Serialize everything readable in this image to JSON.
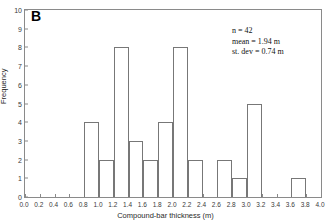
{
  "panel": {
    "label": "B"
  },
  "annotation": {
    "n": "n = 42",
    "mean": "mean = 1.94 m",
    "stdev": "st. dev = 0.74 m"
  },
  "chart_data": {
    "type": "bar",
    "title": "",
    "subtitle": "",
    "xlabel": "Compound-bar thickness (m)",
    "ylabel": "Frequency",
    "xlim": [
      0.0,
      4.0
    ],
    "ylim": [
      0,
      10
    ],
    "bin_width": 0.2,
    "grid": false,
    "legend": "none",
    "xticks": [
      "0.0",
      "0.2",
      "0.4",
      "0.6",
      "0.8",
      "1.0",
      "1.2",
      "1.4",
      "1.6",
      "1.8",
      "2.0",
      "2.2",
      "2.4",
      "2.6",
      "2.8",
      "3.0",
      "3.2",
      "3.4",
      "3.6",
      "3.8",
      "4.0"
    ],
    "xtick_values": [
      0.0,
      0.2,
      0.4,
      0.6,
      0.8,
      1.0,
      1.2,
      1.4,
      1.6,
      1.8,
      2.0,
      2.2,
      2.4,
      2.6,
      2.8,
      3.0,
      3.2,
      3.4,
      3.6,
      3.8,
      4.0
    ],
    "yticks": [
      "0",
      "1",
      "2",
      "3",
      "4",
      "5",
      "6",
      "7",
      "8",
      "9",
      "10"
    ],
    "ytick_values": [
      0,
      1,
      2,
      3,
      4,
      5,
      6,
      7,
      8,
      9,
      10
    ],
    "bin_edges": [
      0.0,
      0.2,
      0.4,
      0.6,
      0.8,
      1.0,
      1.2,
      1.4,
      1.6,
      1.8,
      2.0,
      2.2,
      2.4,
      2.6,
      2.8,
      3.0,
      3.2,
      3.4,
      3.6,
      3.8,
      4.0
    ],
    "categories": [
      "0.0-0.2",
      "0.2-0.4",
      "0.4-0.6",
      "0.6-0.8",
      "0.8-1.0",
      "1.0-1.2",
      "1.2-1.4",
      "1.4-1.6",
      "1.6-1.8",
      "1.8-2.0",
      "2.0-2.2",
      "2.2-2.4",
      "2.4-2.6",
      "2.6-2.8",
      "2.8-3.0",
      "3.0-3.2",
      "3.2-3.4",
      "3.4-3.6",
      "3.6-3.8",
      "3.8-4.0"
    ],
    "values": [
      0,
      0,
      0,
      0,
      4,
      2,
      8,
      3,
      2,
      4,
      8,
      2,
      0,
      2,
      1,
      5,
      0,
      0,
      1,
      0
    ],
    "n": 42,
    "mean": 1.94,
    "st_dev": 0.74
  }
}
